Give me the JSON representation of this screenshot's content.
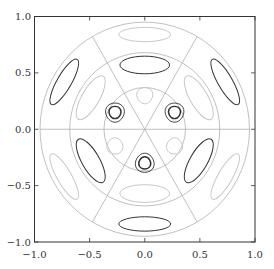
{
  "chart_data": {
    "type": "contour",
    "title": "",
    "xlabel": "",
    "ylabel": "",
    "xlim": [
      -1.0,
      1.0
    ],
    "ylim": [
      -1.0,
      1.0
    ],
    "x_ticks": [
      "-1.0",
      "-0.5",
      "0.0",
      "0.5",
      "1.0"
    ],
    "y_ticks": [
      "-1.0",
      "-0.5",
      "0.0",
      "0.5",
      "1.0"
    ],
    "grid": false,
    "legend": null,
    "guide_circles_r": [
      0.37,
      0.68,
      0.95
    ],
    "guide_lines_angles_deg": [
      0,
      60,
      120
    ],
    "dark_inner_lobes": [
      {
        "cx": -0.27,
        "cy": 0.15,
        "levels": 2
      },
      {
        "cx": 0.27,
        "cy": 0.15,
        "levels": 2
      },
      {
        "cx": 0.0,
        "cy": -0.3,
        "levels": 2
      }
    ],
    "light_inner_lobes": [
      {
        "cx": 0.0,
        "cy": 0.3
      },
      {
        "cx": -0.27,
        "cy": -0.15
      },
      {
        "cx": 0.27,
        "cy": -0.15
      }
    ],
    "dark_middle_lobes": [
      {
        "cx": 0.0,
        "cy": 0.57,
        "angle": 0
      },
      {
        "cx": -0.49,
        "cy": -0.28,
        "angle": 60
      },
      {
        "cx": 0.49,
        "cy": -0.28,
        "angle": -60
      }
    ],
    "light_middle_lobes": [
      {
        "cx": 0.0,
        "cy": -0.57
      },
      {
        "cx": -0.49,
        "cy": 0.28
      },
      {
        "cx": 0.49,
        "cy": 0.28
      }
    ],
    "dark_outer_lobes": [
      {
        "cx": -0.73,
        "cy": 0.42
      },
      {
        "cx": 0.73,
        "cy": 0.42
      },
      {
        "cx": 0.0,
        "cy": -0.84
      }
    ],
    "light_outer_lobes": [
      {
        "cx": 0.0,
        "cy": 0.84
      },
      {
        "cx": -0.73,
        "cy": -0.42
      },
      {
        "cx": 0.73,
        "cy": -0.42
      }
    ]
  },
  "axes": {
    "x_labels": [
      "−1.0",
      "−0.5",
      "0.0",
      "0.5",
      "1.0"
    ],
    "y_labels": [
      "1.0",
      "0.5",
      "0.0",
      "−0.5",
      "−1.0"
    ]
  },
  "colors": {
    "dark": "#333333",
    "light": "#c8c8c8",
    "guide": "#b0b0b0",
    "axis": "#333333"
  }
}
